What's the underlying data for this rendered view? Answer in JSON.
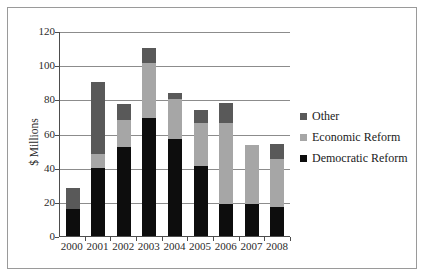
{
  "chart_data": {
    "type": "bar",
    "subtype": "stacked-bar",
    "title": "",
    "xlabel": "",
    "ylabel": "$ Millions",
    "ylim": [
      0,
      120
    ],
    "ytick_step": 20,
    "yticks": [
      0,
      20,
      40,
      60,
      80,
      100,
      120
    ],
    "grid": true,
    "legend_position": "right",
    "categories": [
      "2000",
      "2001",
      "2002",
      "2003",
      "2004",
      "2005",
      "2006",
      "2007",
      "2008"
    ],
    "series": [
      {
        "name": "Democratic Reform",
        "color": "#0d0d0d",
        "values": [
          16,
          40,
          52,
          69,
          57,
          41,
          19,
          19,
          17
        ]
      },
      {
        "name": "Economic Reform",
        "color": "#a6a6a6",
        "values": [
          0,
          8,
          16,
          32,
          23,
          25,
          47,
          34,
          28
        ]
      },
      {
        "name": "Other",
        "color": "#595959",
        "values": [
          12,
          42,
          9,
          9,
          4,
          8,
          12,
          0,
          9
        ]
      }
    ],
    "totals": [
      28,
      90,
      77,
      110,
      84,
      74,
      78,
      53,
      54
    ]
  },
  "legend": {
    "items": [
      {
        "label": "Other",
        "color": "#595959"
      },
      {
        "label": "Economic Reform",
        "color": "#a6a6a6"
      },
      {
        "label": "Democratic Reform",
        "color": "#0d0d0d"
      }
    ]
  }
}
